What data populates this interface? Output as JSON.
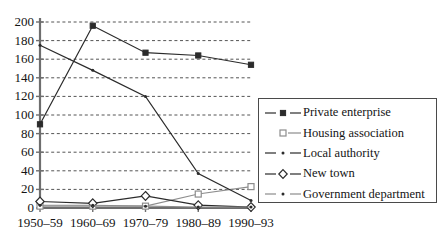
{
  "chart_data": {
    "type": "line",
    "title": "",
    "xlabel": "",
    "ylabel": "",
    "categories": [
      "1950–59",
      "1960–69",
      "1970–79",
      "1980–89",
      "1990–93"
    ],
    "ylim": [
      0,
      200
    ],
    "yticks": [
      0,
      20,
      40,
      60,
      80,
      100,
      120,
      140,
      160,
      180,
      200
    ],
    "grid": true,
    "legend_position": "right",
    "series": [
      {
        "name": "Private enterprise",
        "marker": "filled-square",
        "values": [
          90,
          196,
          167,
          164,
          154
        ]
      },
      {
        "name": "Housing association",
        "marker": "open-square",
        "values": [
          2,
          2,
          2,
          15,
          23
        ]
      },
      {
        "name": "Local authority",
        "marker": "dot",
        "values": [
          175,
          148,
          120,
          37,
          8
        ]
      },
      {
        "name": "New town",
        "marker": "open-diamond",
        "values": [
          7,
          5,
          13,
          3,
          1
        ]
      },
      {
        "name": "Government department",
        "marker": "dot",
        "values": [
          3,
          3,
          2,
          1,
          1
        ]
      }
    ]
  },
  "axis": {
    "ytick_labels": [
      "200",
      "180",
      "160",
      "140",
      "120",
      "100",
      "80",
      "60",
      "40",
      "20",
      "0"
    ],
    "xtick_labels": [
      "1950–59",
      "1960–69",
      "1970–79",
      "1980–89",
      "1990–93"
    ]
  },
  "legend": {
    "items": [
      {
        "label": "Private enterprise",
        "marker": "filled-square"
      },
      {
        "label": "Housing association",
        "marker": "open-square"
      },
      {
        "label": "Local authority",
        "marker": "dot"
      },
      {
        "label": "New town",
        "marker": "open-diamond"
      },
      {
        "label": "Government department",
        "marker": "dot"
      }
    ]
  },
  "colors": {
    "line": "#2b2b2b",
    "grid": "#545454",
    "axis": "#6e6e6e",
    "text": "#141414",
    "light_line": "#8d8d8d"
  }
}
